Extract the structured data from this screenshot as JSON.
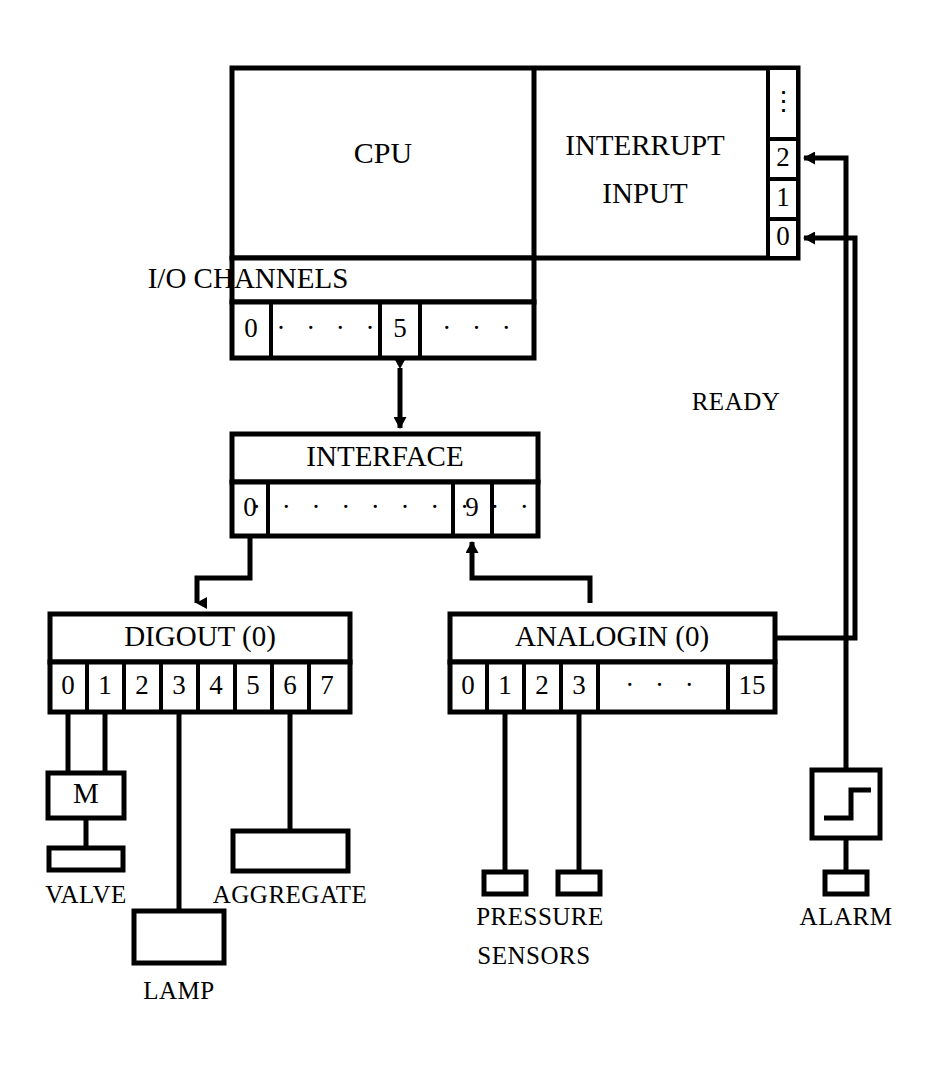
{
  "diagram": {
    "cpu": {
      "label": "CPU"
    },
    "interrupt": {
      "label_line1": "INTERRUPT",
      "label_line2": "INPUT",
      "levels": [
        "⋮",
        "2",
        "1",
        "0"
      ]
    },
    "io_channels": {
      "label": "I/O CHANNELS",
      "cells": [
        "0",
        "· · · ·",
        "5",
        "· · ·"
      ]
    },
    "interface": {
      "label": "INTERFACE",
      "cells": [
        "0",
        "· · · · · · · ·",
        "9",
        "· ·"
      ]
    },
    "digout": {
      "label": "DIGOUT (0)",
      "cells": [
        "0",
        "1",
        "2",
        "3",
        "4",
        "5",
        "6",
        "7"
      ]
    },
    "analogin": {
      "label": "ANALOGIN (0)",
      "cells": [
        "0",
        "1",
        "2",
        "3",
        "·  ·  ·",
        "15"
      ]
    },
    "devices": {
      "motor": {
        "label": "M"
      },
      "valve": {
        "label": "VALVE"
      },
      "lamp": {
        "label": "LAMP"
      },
      "aggregate": {
        "label": "AGGREGATE"
      },
      "pressure_sensors": {
        "label_line1": "PRESSURE",
        "label_line2": "SENSORS"
      },
      "alarm": {
        "label": "ALARM",
        "symbol": "step-function"
      }
    },
    "signals": {
      "ready": "READY"
    },
    "colors": {
      "ink": "#000000",
      "paper": "#ffffff"
    }
  }
}
